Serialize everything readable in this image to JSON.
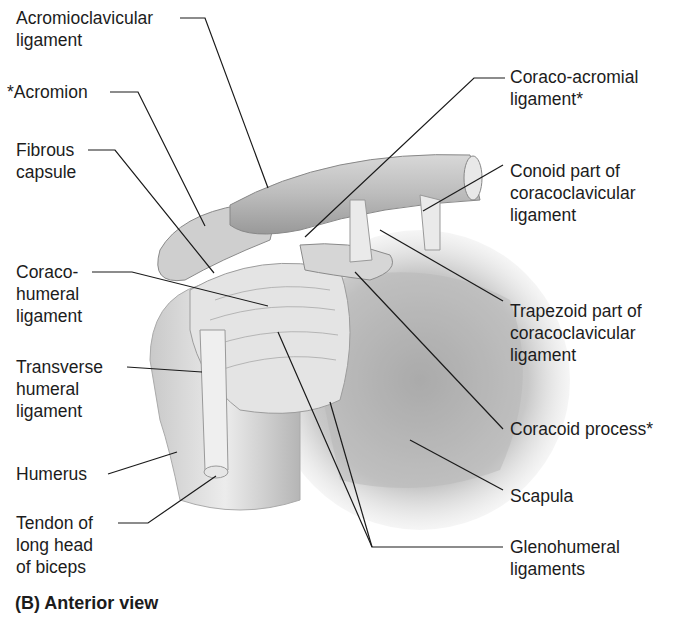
{
  "figure": {
    "caption": "(B) Anterior view",
    "labels_left": [
      {
        "id": "acromioclavicular-ligament",
        "text": "Acromioclavicular\nligament"
      },
      {
        "id": "acromion",
        "text": "*Acromion"
      },
      {
        "id": "fibrous-capsule",
        "text": "Fibrous\ncapsule"
      },
      {
        "id": "coracohumeral-ligament",
        "text": "Coraco-\nhumeral\nligament"
      },
      {
        "id": "transverse-humeral-ligament",
        "text": "Transverse\nhumeral\nligament"
      },
      {
        "id": "humerus",
        "text": "Humerus"
      },
      {
        "id": "tendon-long-head-biceps",
        "text": "Tendon of\nlong head\nof biceps"
      }
    ],
    "labels_right": [
      {
        "id": "coraco-acromial-ligament",
        "text": "Coraco-acromial\nligament*"
      },
      {
        "id": "conoid-part",
        "text": "Conoid part of\ncoracoclavicular\nligament"
      },
      {
        "id": "trapezoid-part",
        "text": "Trapezoid part of\ncoracoclavicular\nligament"
      },
      {
        "id": "coracoid-process",
        "text": "Coracoid process*"
      },
      {
        "id": "scapula",
        "text": "Scapula"
      },
      {
        "id": "glenohumeral-ligaments",
        "text": "Glenohumeral\nligaments"
      }
    ]
  }
}
